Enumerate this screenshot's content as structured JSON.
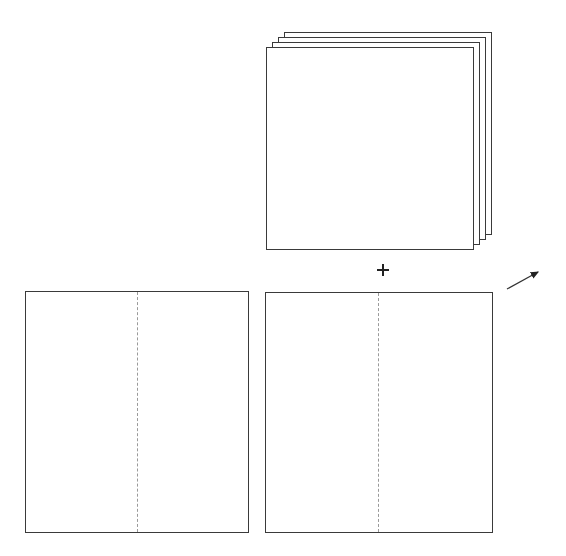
{
  "diagram": {
    "stack": {
      "sheet_count": 4,
      "front": {
        "left": 266,
        "top": 47,
        "right": 473,
        "bottom": 249
      },
      "offset_x": 6,
      "offset_y": -5
    },
    "plus_symbol": {
      "glyph": "+",
      "cx": 383,
      "cy": 270
    },
    "arrow": {
      "x1": 507,
      "y1": 289,
      "x2": 540,
      "y2": 271,
      "icon": "arrow-up-right-icon"
    },
    "squares": [
      {
        "name": "left",
        "left": 25,
        "top": 291,
        "right": 249,
        "bottom": 533,
        "fold_x": 137,
        "fold_style": "dashed"
      },
      {
        "name": "right",
        "left": 265,
        "top": 292,
        "right": 493,
        "bottom": 533,
        "fold_x": 378,
        "fold_style": "dashed"
      }
    ],
    "colors": {
      "stroke": "#3a3a3a",
      "fold_line": "#9a9a9a",
      "background": "#ffffff"
    }
  }
}
